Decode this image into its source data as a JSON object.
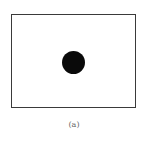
{
  "figure": {
    "caption": "(a)",
    "frame_color": "#3a3a3a",
    "dot_color": "#0a0a0a",
    "shapes": [
      {
        "type": "rectangle",
        "label": "frame"
      },
      {
        "type": "circle",
        "label": "filled-dot",
        "position": "center"
      }
    ]
  }
}
